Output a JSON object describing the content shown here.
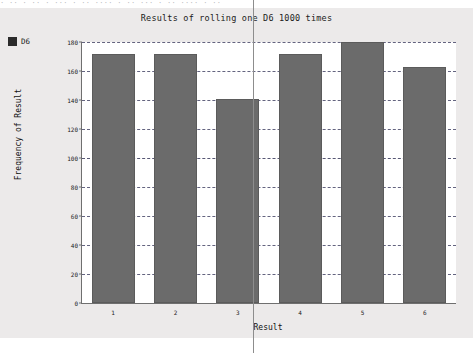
{
  "window": {
    "sliver_text": "· ·· ·  ·· · ··· · ··  ···· · ·· ···  · ·· ···· · ··"
  },
  "legend": {
    "position": "top-left",
    "swatch_color": "#2b2b2b",
    "entries": [
      {
        "label": "D6",
        "color": "#2b2b2b"
      }
    ]
  },
  "colors": {
    "panel_background": "#eceaea",
    "plot_background": "#ffffff",
    "bar_fill": "#6b6b6b",
    "bar_stroke": "#5b5b5b",
    "gridline": "#4a4a6a",
    "axis": "#6f6f6f",
    "text": "#1b1b1b"
  },
  "chart_data": {
    "type": "bar",
    "title": "Results of rolling one D6 1000 times",
    "xlabel": "Result",
    "ylabel": "Frequency of Result",
    "categories": [
      "1",
      "2",
      "3",
      "4",
      "5",
      "6"
    ],
    "values": [
      172,
      172,
      141,
      172,
      180,
      163
    ],
    "series": [
      {
        "name": "D6",
        "color": "#6b6b6b",
        "values": [
          172,
          172,
          141,
          172,
          180,
          163
        ]
      }
    ],
    "ylim": [
      0,
      180
    ],
    "yticks": [
      0,
      20,
      40,
      60,
      80,
      100,
      120,
      140,
      160,
      180
    ],
    "ytick_labels": [
      "0",
      "20",
      "40",
      "60",
      "80",
      "100",
      "120",
      "140",
      "160",
      "180"
    ],
    "xtick_labels": [
      "1",
      "2",
      "3",
      "4",
      "5",
      "6"
    ],
    "grid": true,
    "grid_axis": "y",
    "legend_position": "top-left",
    "total_rolls": 1000
  }
}
